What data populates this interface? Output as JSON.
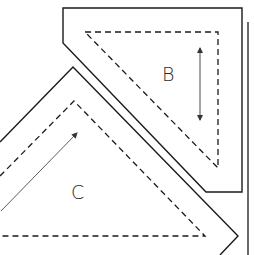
{
  "diagram": {
    "type": "sewing-pattern-pieces",
    "colors": {
      "background": "#ffffff",
      "cut_line": "#1a1a1a",
      "seam_line": "#1a1a1a",
      "grain_arrow": "#333333"
    },
    "pieces": [
      {
        "id": "B",
        "label": "B",
        "shape": "right-triangle with seam allowance",
        "grainline": "vertical double-headed arrow"
      },
      {
        "id": "C",
        "label": "C",
        "shape": "isosceles right triangle with seam allowance (partially cropped)",
        "grainline": "diagonal single-headed arrow"
      }
    ],
    "line_legend": {
      "solid": "cutting line",
      "dashed": "stitching line"
    }
  }
}
